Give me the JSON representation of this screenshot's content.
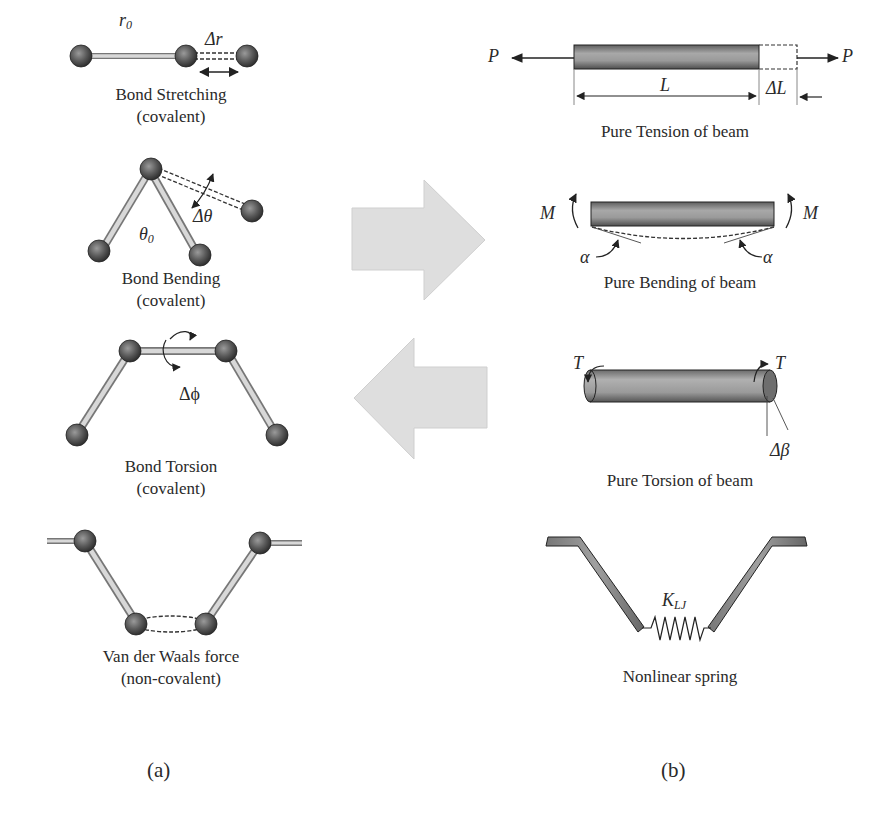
{
  "figure": {
    "panels": [
      {
        "id": "a",
        "label": "(a)",
        "items": [
          {
            "caption_line1": "Bond Stretching",
            "caption_line2": "(covalent)",
            "symbols": {
              "r0": "r",
              "r0_sub": "0",
              "dr": "Δr"
            }
          },
          {
            "caption_line1": "Bond Bending",
            "caption_line2": "(covalent)",
            "symbols": {
              "theta0": "θ",
              "theta0_sub": "0",
              "dtheta": "Δθ"
            }
          },
          {
            "caption_line1": "Bond Torsion",
            "caption_line2": "(covalent)",
            "symbols": {
              "dphi": "Δϕ"
            }
          },
          {
            "caption_line1": "Van der Waals force",
            "caption_line2": "(non-covalent)"
          }
        ]
      },
      {
        "id": "b",
        "label": "(b)",
        "items": [
          {
            "caption": "Pure Tension of beam",
            "symbols": {
              "P_left": "P",
              "P_right": "P",
              "L": "L",
              "dL": "ΔL"
            }
          },
          {
            "caption": "Pure Bending of beam",
            "symbols": {
              "M_left": "M",
              "M_right": "M",
              "alpha_left": "α",
              "alpha_right": "α"
            }
          },
          {
            "caption": "Pure Torsion of beam",
            "symbols": {
              "T_left": "T",
              "T_right": "T",
              "dbeta": "Δβ"
            }
          },
          {
            "caption": "Nonlinear spring",
            "symbols": {
              "K": "K",
              "K_sub": "LJ"
            }
          }
        ]
      }
    ],
    "arrows": [
      {
        "direction": "right",
        "meaning": "molecular to structural mapping"
      },
      {
        "direction": "left",
        "meaning": "structural to molecular mapping"
      }
    ],
    "colors": {
      "atom": "#4a4a4a",
      "bond": "#cfcfcf",
      "beam": "#8c8c8c",
      "arrow_fill": "#dcdcdc",
      "text": "#2a2a2a"
    }
  }
}
